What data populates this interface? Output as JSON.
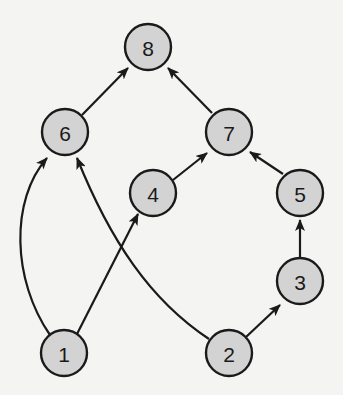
{
  "diagram": {
    "type": "directed-graph",
    "background": "#f4f4f2",
    "node_fill": "#d3d3d3",
    "stroke_color": "#1a1a1a",
    "node_radius": 23,
    "nodes": [
      {
        "id": "1",
        "label": "1",
        "x": 64,
        "y": 353
      },
      {
        "id": "2",
        "label": "2",
        "x": 229,
        "y": 353
      },
      {
        "id": "3",
        "label": "3",
        "x": 300,
        "y": 281
      },
      {
        "id": "4",
        "label": "4",
        "x": 153,
        "y": 193
      },
      {
        "id": "5",
        "label": "5",
        "x": 300,
        "y": 193
      },
      {
        "id": "6",
        "label": "6",
        "x": 65,
        "y": 132
      },
      {
        "id": "7",
        "label": "7",
        "x": 229,
        "y": 132
      },
      {
        "id": "8",
        "label": "8",
        "x": 148,
        "y": 47
      }
    ],
    "edges": [
      {
        "from": "1",
        "to": "6",
        "curve": "M 50 335 C 12 280, 10 200, 47 158"
      },
      {
        "from": "1",
        "to": "4",
        "curve": "M 77 334 L 138 214"
      },
      {
        "from": "2",
        "to": "6",
        "curve": "M 209 339 C 150 300, 110 240, 77 158"
      },
      {
        "from": "2",
        "to": "3",
        "curve": "M 246 337 L 280 305"
      },
      {
        "from": "3",
        "to": "5",
        "curve": "M 300 258 L 300 220"
      },
      {
        "from": "4",
        "to": "7",
        "curve": "M 173 180 L 207 153"
      },
      {
        "from": "5",
        "to": "7",
        "curve": "M 283 174 L 250 152"
      },
      {
        "from": "6",
        "to": "8",
        "curve": "M 82 115 L 128 68"
      },
      {
        "from": "7",
        "to": "8",
        "curve": "M 212 113 L 168 68"
      }
    ]
  }
}
